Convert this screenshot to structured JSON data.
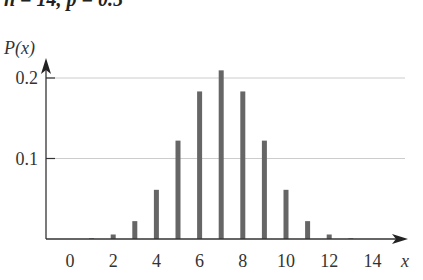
{
  "chart_data": {
    "type": "bar",
    "title": "n = 14, p = 0.5",
    "xlabel": "x",
    "ylabel": "P(x)",
    "x": [
      0,
      1,
      2,
      3,
      4,
      5,
      6,
      7,
      8,
      9,
      10,
      11,
      12,
      13,
      14
    ],
    "values": [
      0.0001,
      0.0009,
      0.0056,
      0.0222,
      0.0611,
      0.1222,
      0.1833,
      0.2095,
      0.1833,
      0.1222,
      0.0611,
      0.0222,
      0.0056,
      0.0009,
      0.0001
    ],
    "xticks": [
      0,
      2,
      4,
      6,
      8,
      10,
      12,
      14
    ],
    "yticks": [
      0.1,
      0.2
    ],
    "ytick_labels": [
      "0.1",
      "0.2"
    ],
    "ylim": [
      0,
      0.22
    ],
    "xlim": [
      -1,
      15
    ],
    "grid": "horizontal at y ticks",
    "bar_color": "#666666",
    "grid_color": "#cccccc",
    "axis_color": "#333333"
  }
}
